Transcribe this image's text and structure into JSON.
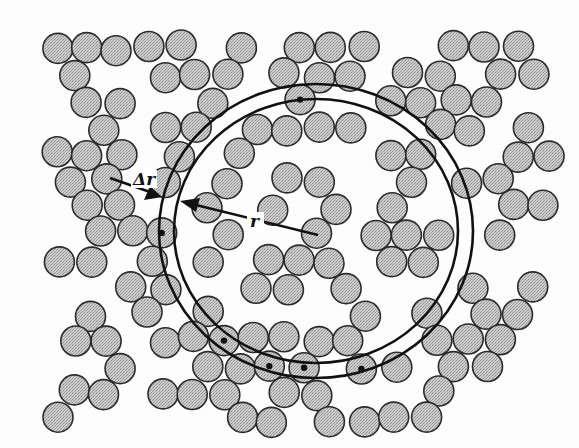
{
  "figure": {
    "labels": {
      "shell_thickness": "Δr",
      "radius": "r"
    },
    "colors": {
      "particle_fill": "#c4c4c4",
      "particle_stroke": "#2a2a2a",
      "ring": "#111111",
      "background": "#fdfdfd"
    },
    "particle_radius": 15,
    "shell": {
      "center": [
        316,
        231
      ],
      "inner_radius": [
        142,
        132
      ],
      "outer_radius": [
        157,
        147
      ]
    }
  }
}
